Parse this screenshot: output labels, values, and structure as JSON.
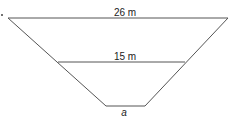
{
  "diagram": {
    "type": "trapezoid",
    "colors": {
      "stroke": "#555555",
      "text": "#222222",
      "background": "#ffffff"
    },
    "labels": {
      "top": "26 m",
      "middle": "15 m",
      "bottom": "a"
    }
  }
}
